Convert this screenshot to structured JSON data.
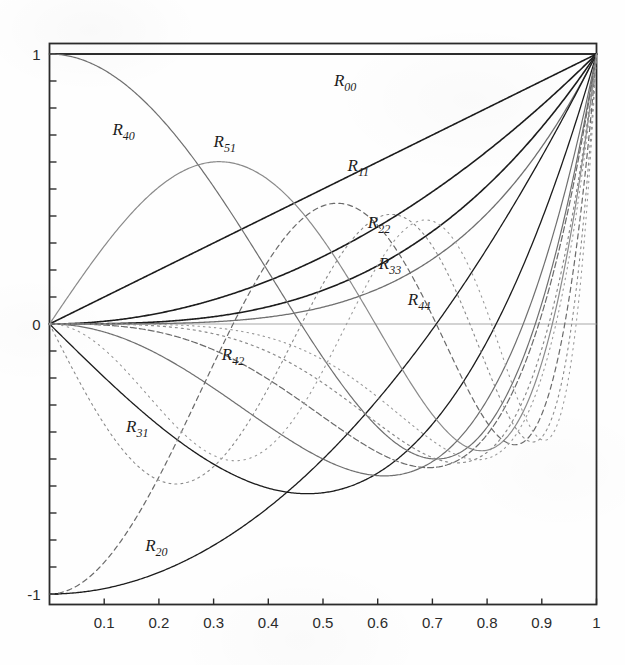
{
  "figure": {
    "title": "",
    "background_color": "#fefefe",
    "frame_color": "#2b2b2b"
  },
  "chart_data": {
    "type": "line",
    "title": "",
    "xlabel": "",
    "ylabel": "",
    "xlim": [
      0,
      1
    ],
    "ylim": [
      -1,
      1
    ],
    "grid": false,
    "legend": "inline-curve-labels",
    "x_ticks": [
      "0.1",
      "0.2",
      "0.3",
      "0.4",
      "0.5",
      "0.6",
      "0.7",
      "0.8",
      "0.9",
      "1"
    ],
    "x_tick_values": [
      0.1,
      0.2,
      0.3,
      0.4,
      0.5,
      0.6,
      0.7,
      0.8,
      0.9,
      1.0
    ],
    "y_ticks": [
      "1",
      "0",
      "-1"
    ],
    "y_tick_values": [
      1,
      0,
      -1
    ],
    "y_minor_tick_step": 0.1,
    "series": [
      {
        "name": "R00",
        "label": "R",
        "sub": "00",
        "n": 0,
        "m": 0,
        "color": "#1c1c1c",
        "dash": "none",
        "width": 1.6,
        "label_x": 0.52,
        "label_y": 0.88,
        "values_at_ticks": [
          1,
          1,
          1,
          1,
          1,
          1,
          1,
          1,
          1,
          1,
          1
        ]
      },
      {
        "name": "R11",
        "label": "R",
        "sub": "11",
        "n": 1,
        "m": 1,
        "color": "#1c1c1c",
        "dash": "none",
        "width": 1.6,
        "label_x": 0.545,
        "label_y": 0.565,
        "values_at_ticks": [
          0,
          0.1,
          0.2,
          0.3,
          0.4,
          0.5,
          0.6,
          0.7,
          0.8,
          0.9,
          1
        ]
      },
      {
        "name": "R22",
        "label": "R",
        "sub": "22",
        "n": 2,
        "m": 2,
        "color": "#1c1c1c",
        "dash": "none",
        "width": 1.6,
        "label_x": 0.582,
        "label_y": 0.355,
        "values_at_ticks": [
          0,
          0.01,
          0.04,
          0.09,
          0.16,
          0.25,
          0.36,
          0.49,
          0.64,
          0.81,
          1
        ]
      },
      {
        "name": "R33",
        "label": "R",
        "sub": "33",
        "n": 3,
        "m": 3,
        "color": "#1c1c1c",
        "dash": "none",
        "width": 1.6,
        "label_x": 0.602,
        "label_y": 0.205,
        "values_at_ticks": [
          0,
          0.001,
          0.008,
          0.027,
          0.064,
          0.125,
          0.216,
          0.343,
          0.512,
          0.729,
          1
        ]
      },
      {
        "name": "R44",
        "label": "R",
        "sub": "44",
        "n": 4,
        "m": 4,
        "color": "#6f6f6f",
        "dash": "none",
        "width": 1.3,
        "label_x": 0.655,
        "label_y": 0.07,
        "values_at_ticks": [
          0,
          0.0001,
          0.0016,
          0.0081,
          0.0256,
          0.0625,
          0.1296,
          0.2401,
          0.4096,
          0.6561,
          1
        ]
      },
      {
        "name": "R20",
        "label": "R",
        "sub": "20",
        "n": 2,
        "m": 0,
        "color": "#1c1c1c",
        "dash": "none",
        "width": 1.3,
        "label_x": 0.175,
        "label_y": -0.84,
        "values_at_ticks": [
          -1,
          -0.98,
          -0.92,
          -0.82,
          -0.68,
          -0.5,
          -0.28,
          -0.02,
          0.28,
          0.62,
          1
        ]
      },
      {
        "name": "R31",
        "label": "R",
        "sub": "31",
        "n": 3,
        "m": 1,
        "color": "#1c1c1c",
        "dash": "none",
        "width": 1.3,
        "label_x": 0.14,
        "label_y": -0.4,
        "values_at_ticks": [
          0,
          -0.197,
          -0.376,
          -0.519,
          -0.608,
          -0.625,
          -0.552,
          -0.371,
          -0.064,
          0.387,
          1
        ]
      },
      {
        "name": "R40",
        "label": "R",
        "sub": "40",
        "n": 4,
        "m": 0,
        "color": "#6f6f6f",
        "dash": "none",
        "width": 1.2,
        "label_x": 0.115,
        "label_y": 0.7,
        "values_at_ticks": [
          1,
          0.9406,
          0.7696,
          0.5146,
          0.2176,
          -0.125,
          -0.3344,
          -0.3374,
          -0.0704,
          0.5626,
          1
        ]
      },
      {
        "name": "R42",
        "label": "R",
        "sub": "42",
        "n": 4,
        "m": 2,
        "color": "#6f6f6f",
        "dash": "none",
        "width": 1.2,
        "label_x": 0.315,
        "label_y": -0.135,
        "values_at_ticks": [
          0,
          -0.0296,
          -0.1056,
          -0.2106,
          -0.3136,
          -0.375,
          -0.3456,
          -0.1666,
          0.2304,
          0.8586,
          1
        ]
      },
      {
        "name": "R51",
        "label": "R",
        "sub": "51",
        "n": 5,
        "m": 1,
        "color": "#8a8a8a",
        "dash": "none",
        "width": 1.2,
        "label_x": 0.3,
        "label_y": 0.655,
        "values_at_ticks": [
          0,
          0.2804,
          0.4832,
          0.5958,
          0.6208,
          0.5625,
          0.4128,
          0.1456,
          -0.2432,
          -0.5868,
          1
        ]
      },
      {
        "name": "R53",
        "label": "",
        "sub": "",
        "n": 5,
        "m": 3,
        "color": "#6a6a6a",
        "dash": "6 3",
        "width": 1.2,
        "label_x": null,
        "label_y": null,
        "values_at_ticks": [
          0,
          -0.0039,
          -0.0288,
          -0.0837,
          -0.1664,
          -0.25,
          -0.2808,
          -0.1715,
          0.1536,
          0.7533,
          1
        ]
      },
      {
        "name": "R60",
        "label": "",
        "sub": "",
        "n": 6,
        "m": 0,
        "color": "#6a6a6a",
        "dash": "5 4",
        "width": 1.2,
        "label_x": null,
        "label_y": null,
        "values_at_ticks": [
          -1,
          -0.8262,
          -0.3856,
          0.1222,
          0.4784,
          0.5625,
          0.3728,
          0.0382,
          -0.22,
          -0.1618,
          1
        ]
      },
      {
        "name": "R64",
        "label": "",
        "sub": "",
        "n": 6,
        "m": 4,
        "color": "#8a8a8a",
        "dash": "2 4",
        "width": 1.2,
        "label_x": null,
        "label_y": null,
        "values_at_ticks": [
          0,
          -0.0005,
          -0.0077,
          -0.0354,
          -0.0922,
          -0.1719,
          -0.2332,
          -0.1883,
          0.0819,
          0.7186,
          1
        ]
      },
      {
        "name": "R71",
        "label": "",
        "sub": "",
        "n": 7,
        "m": 1,
        "color": "#8a8a8a",
        "dash": "2 4",
        "width": 1.1,
        "label_x": null,
        "label_y": null,
        "values_at_ticks": [
          0,
          -0.3243,
          -0.5043,
          -0.5089,
          -0.3584,
          -0.1563,
          -0.024,
          -0.0885,
          -0.2969,
          -0.2871,
          1
        ]
      },
      {
        "name": "R75",
        "label": "",
        "sub": "",
        "n": 7,
        "m": 5,
        "color": "#9a9a9a",
        "dash": "1.5 4",
        "width": 1.1,
        "label_x": null,
        "label_y": null,
        "values_at_ticks": [
          0,
          -6e-05,
          -0.002,
          -0.0142,
          -0.0512,
          -0.1172,
          -0.1866,
          -0.1848,
          0.0344,
          0.6617,
          1
        ]
      },
      {
        "name": "R82",
        "label": "",
        "sub": "",
        "n": 8,
        "m": 2,
        "color": "#9a9a9a",
        "dash": "1.5 4.5",
        "width": 1.1,
        "label_x": null,
        "label_y": null,
        "values_at_ticks": [
          0,
          0.025,
          0.0678,
          0.0233,
          -0.083,
          -0.1406,
          -0.0576,
          0.0389,
          -0.127,
          -0.2886,
          1
        ]
      }
    ]
  },
  "axes": {
    "y_top_label": "1",
    "y_mid_label": "0",
    "y_bottom_label": "-1"
  }
}
